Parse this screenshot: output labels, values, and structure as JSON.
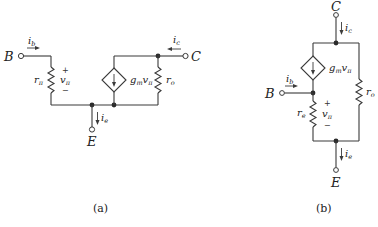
{
  "figure": {
    "circuit_a": {
      "caption": "(a)",
      "terminals": {
        "base": "B",
        "collector": "C",
        "emitter": "E"
      },
      "currents": {
        "base": "i",
        "base_sub": "b",
        "collector": "i",
        "collector_sub": "c",
        "emitter": "i",
        "emitter_sub": "e"
      },
      "components": {
        "r_pi": {
          "label": "r",
          "sub": "π"
        },
        "v_pi": {
          "label": "v",
          "sub": "π",
          "plus": "+",
          "minus": "−"
        },
        "dep_source": {
          "label_g": "g",
          "label_g_sub": "m",
          "label_v": "v",
          "label_v_sub": "π"
        },
        "r_o": {
          "label": "r",
          "sub": "o"
        }
      }
    },
    "circuit_b": {
      "caption": "(b)",
      "terminals": {
        "base": "B",
        "collector": "C",
        "emitter": "E"
      },
      "currents": {
        "base": "i",
        "base_sub": "b",
        "collector": "i",
        "collector_sub": "c",
        "emitter": "i",
        "emitter_sub": "e"
      },
      "components": {
        "r_e": {
          "label": "r",
          "sub": "e"
        },
        "v_pi": {
          "label": "v",
          "sub": "π",
          "plus": "+",
          "minus": "−"
        },
        "dep_source": {
          "label_g": "g",
          "label_g_sub": "m",
          "label_v": "v",
          "label_v_sub": "π"
        },
        "r_o": {
          "label": "r",
          "sub": "o"
        }
      }
    }
  }
}
